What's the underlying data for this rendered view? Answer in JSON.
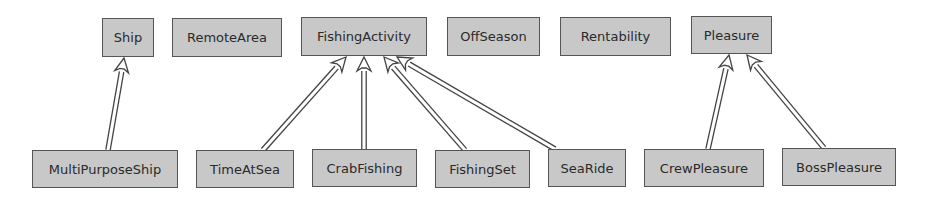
{
  "diagram": {
    "type": "class-inheritance",
    "nodes": [
      {
        "id": "Ship",
        "label": "Ship",
        "x": 102,
        "y": 18,
        "w": 52,
        "h": 39
      },
      {
        "id": "RemoteArea",
        "label": "RemoteArea",
        "x": 172,
        "y": 18,
        "w": 110,
        "h": 39
      },
      {
        "id": "FishingActivity",
        "label": "FishingActivity",
        "x": 301,
        "y": 17,
        "w": 126,
        "h": 39
      },
      {
        "id": "OffSeason",
        "label": "OffSeason",
        "x": 447,
        "y": 17,
        "w": 93,
        "h": 39
      },
      {
        "id": "Rentability",
        "label": "Rentability",
        "x": 560,
        "y": 17,
        "w": 111,
        "h": 39
      },
      {
        "id": "Pleasure",
        "label": "Pleasure",
        "x": 691,
        "y": 16,
        "w": 81,
        "h": 38
      },
      {
        "id": "MultiPurposeShip",
        "label": "MultiPurposeShip",
        "x": 32,
        "y": 150,
        "w": 146,
        "h": 38
      },
      {
        "id": "TimeAtSea",
        "label": "TimeAtSea",
        "x": 196,
        "y": 150,
        "w": 98,
        "h": 38
      },
      {
        "id": "CrabFishing",
        "label": "CrabFishing",
        "x": 312,
        "y": 149,
        "w": 105,
        "h": 38
      },
      {
        "id": "FishingSet",
        "label": "FishingSet",
        "x": 435,
        "y": 150,
        "w": 95,
        "h": 38
      },
      {
        "id": "SeaRide",
        "label": "SeaRide",
        "x": 548,
        "y": 149,
        "w": 78,
        "h": 38
      },
      {
        "id": "CrewPleasure",
        "label": "CrewPleasure",
        "x": 644,
        "y": 149,
        "w": 120,
        "h": 38
      },
      {
        "id": "BossPleasure",
        "label": "BossPleasure",
        "x": 782,
        "y": 148,
        "w": 114,
        "h": 38
      }
    ],
    "edges": [
      {
        "from": "MultiPurposeShip",
        "to": "Ship",
        "x1": 108,
        "y1": 150,
        "x2": 124,
        "y2": 58
      },
      {
        "from": "TimeAtSea",
        "to": "FishingActivity",
        "x1": 263,
        "y1": 150,
        "x2": 346,
        "y2": 57
      },
      {
        "from": "CrabFishing",
        "to": "FishingActivity",
        "x1": 364,
        "y1": 149,
        "x2": 364,
        "y2": 57
      },
      {
        "from": "FishingSet",
        "to": "FishingActivity",
        "x1": 465,
        "y1": 150,
        "x2": 384,
        "y2": 57
      },
      {
        "from": "SeaRide",
        "to": "FishingActivity",
        "x1": 555,
        "y1": 149,
        "x2": 397,
        "y2": 57
      },
      {
        "from": "CrewPleasure",
        "to": "Pleasure",
        "x1": 708,
        "y1": 149,
        "x2": 729,
        "y2": 55
      },
      {
        "from": "BossPleasure",
        "to": "Pleasure",
        "x1": 824,
        "y1": 148,
        "x2": 747,
        "y2": 55
      }
    ]
  },
  "colors": {
    "node_fill": "#c8c8c8",
    "node_border": "#555555",
    "edge": "#444444",
    "text": "#2a2a2a"
  }
}
